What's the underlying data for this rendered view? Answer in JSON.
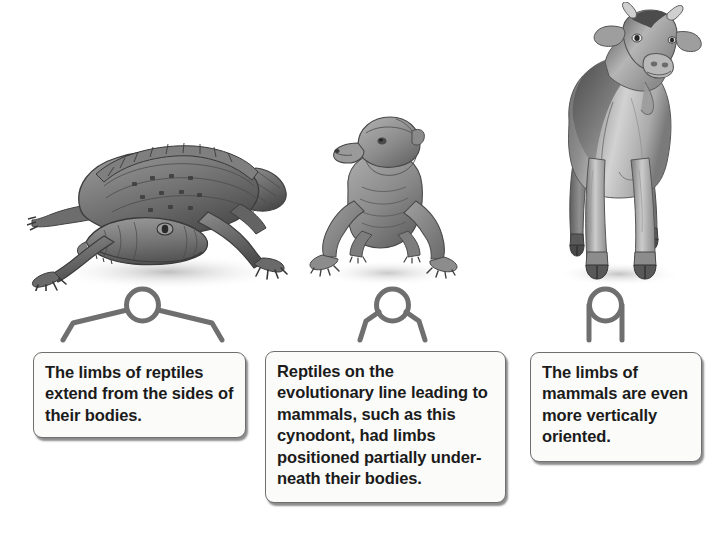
{
  "figure": {
    "background_color": "#ffffff",
    "ink_color": "#6f6f6f",
    "text_color": "#1b1b1b"
  },
  "panels": [
    {
      "id": "reptile",
      "illustration_name": "crocodile-illustration",
      "illustration_alt": "Grayscale drawing of a crocodile with limbs sprawling out to the sides",
      "schematic_name": "limb-schematic-sprawling",
      "schematic_alt": "Circle body with limbs angled outward from the sides",
      "caption": "The limbs of reptiles extend from the sides of their bodies."
    },
    {
      "id": "cynodont",
      "illustration_name": "cynodont-illustration",
      "illustration_alt": "Grayscale drawing of a cynodont, a mammal-like reptile, facing forward",
      "schematic_name": "limb-schematic-semi-erect",
      "schematic_alt": "Circle body with limbs angled partially underneath",
      "caption": "Reptiles on the evolutionary line leading to mammals, such as this cynodont, had limbs positioned partially under-\nneath their bodies."
    },
    {
      "id": "mammal",
      "illustration_name": "cow-illustration",
      "illustration_alt": "Grayscale drawing of a cow standing facing forward on vertical legs",
      "schematic_name": "limb-schematic-erect",
      "schematic_alt": "Circle body with straight vertical limbs directly beneath",
      "caption": "The limbs of mammals are even more vertically oriented."
    }
  ]
}
